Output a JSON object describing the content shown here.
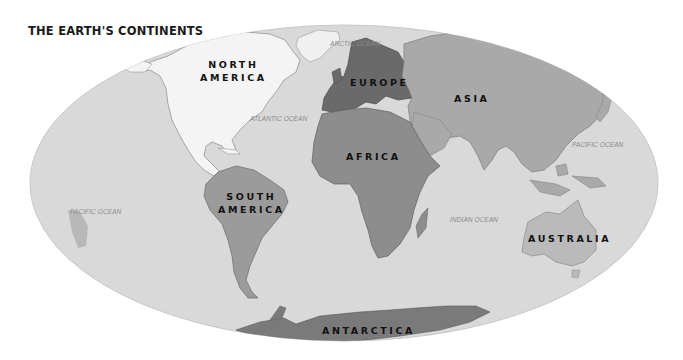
{
  "title": "THE EARTH'S CONTINENTS",
  "map": {
    "projection": "elliptical world map",
    "colors": {
      "background": "#ffffff",
      "ocean": "#d9d9d9",
      "north_america": "#f4f4f4",
      "south_america": "#9b9b9b",
      "europe": "#6a6a6a",
      "asia": "#a9a9a9",
      "africa": "#8d8d8d",
      "australia": "#bababa",
      "antarctica": "#7a7a7a",
      "greenland": "#f0f0f0"
    }
  },
  "continents": {
    "north_america": {
      "line1": "NORTH",
      "line2": "AMERICA"
    },
    "south_america": {
      "line1": "SOUTH",
      "line2": "AMERICA"
    },
    "europe": "EUROPE",
    "asia": "ASIA",
    "africa": "AFRICA",
    "australia": "AUSTRALIA",
    "antarctica": "ANTARCTICA"
  },
  "oceans": {
    "arctic": "ARCTIC OCEAN",
    "atlantic": "ATLANTIC OCEAN",
    "pacific_east": "PACIFIC OCEAN",
    "pacific_west": "PACIFIC OCEAN",
    "indian": "INDIAN OCEAN"
  }
}
